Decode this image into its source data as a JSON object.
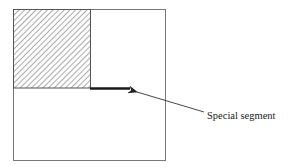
{
  "diagram": {
    "label": "Special segment",
    "colors": {
      "outline": "#777777",
      "hatch": "#555555",
      "segment": "#1a1a1a",
      "arrow": "#333333",
      "text": "#222222"
    }
  }
}
